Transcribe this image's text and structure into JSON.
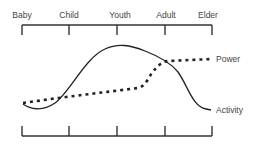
{
  "stages": [
    "Baby",
    "Child",
    "Youth",
    "Adult",
    "Elder"
  ],
  "series": [
    {
      "name": "Power",
      "style": "dotted",
      "color": "#222222"
    },
    {
      "name": "Activity",
      "style": "solid",
      "color": "#222222"
    }
  ],
  "labels": {
    "power": "Power",
    "activity": "Activity"
  },
  "colors": {
    "line": "#222222",
    "axis": "#333333",
    "text": "#444444"
  }
}
